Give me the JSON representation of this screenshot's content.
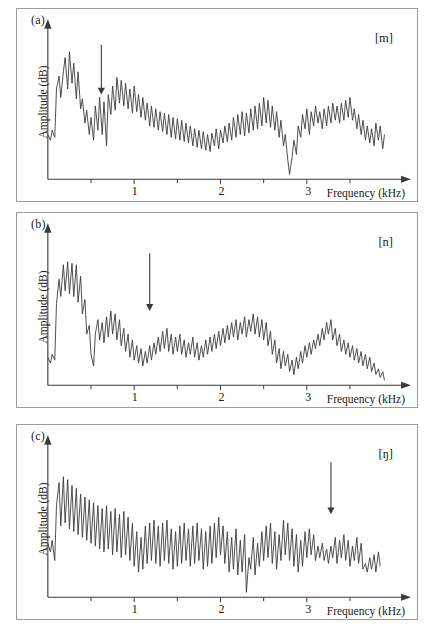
{
  "figure": {
    "background": "#ffffff",
    "line_color": "#3a3a3a",
    "axis_color": "#3a3a3a",
    "border_color": "#9a9a9a"
  },
  "chart_data": [
    {
      "type": "line",
      "panel": "a",
      "panel_label": "(a)",
      "annotation_label": "[m]",
      "title": "",
      "xlabel": "Frequency (kHz)",
      "ylabel": "Amplitude (dB)",
      "xlim": [
        0,
        4
      ],
      "ylim": [
        0,
        1
      ],
      "xticks": [
        1,
        2,
        3
      ],
      "xtick_labels": [
        "1",
        "2",
        "3"
      ],
      "minor_xticks": [
        0.5,
        1.5,
        2.5,
        3.5
      ],
      "grid": false,
      "legend": false,
      "arrow": {
        "x": 0.62,
        "y_top": 0.93,
        "y_bottom": 0.58,
        "direction": "down"
      },
      "x": [
        0.0,
        0.03,
        0.05,
        0.08,
        0.1,
        0.13,
        0.15,
        0.18,
        0.2,
        0.23,
        0.25,
        0.28,
        0.3,
        0.33,
        0.35,
        0.38,
        0.4,
        0.43,
        0.45,
        0.48,
        0.5,
        0.53,
        0.55,
        0.58,
        0.6,
        0.63,
        0.65,
        0.68,
        0.7,
        0.73,
        0.75,
        0.78,
        0.8,
        0.83,
        0.85,
        0.88,
        0.9,
        0.93,
        0.95,
        0.98,
        1.0,
        1.03,
        1.05,
        1.08,
        1.1,
        1.13,
        1.15,
        1.18,
        1.2,
        1.23,
        1.25,
        1.28,
        1.3,
        1.33,
        1.35,
        1.38,
        1.4,
        1.43,
        1.45,
        1.48,
        1.5,
        1.53,
        1.55,
        1.58,
        1.6,
        1.63,
        1.65,
        1.68,
        1.7,
        1.73,
        1.75,
        1.78,
        1.8,
        1.83,
        1.85,
        1.88,
        1.9,
        1.93,
        1.95,
        1.98,
        2.0,
        2.03,
        2.05,
        2.08,
        2.1,
        2.13,
        2.15,
        2.18,
        2.2,
        2.23,
        2.25,
        2.28,
        2.3,
        2.33,
        2.35,
        2.38,
        2.4,
        2.43,
        2.45,
        2.48,
        2.5,
        2.53,
        2.55,
        2.58,
        2.6,
        2.63,
        2.65,
        2.68,
        2.7,
        2.73,
        2.75,
        2.78,
        2.8,
        2.83,
        2.85,
        2.88,
        2.9,
        2.93,
        2.95,
        2.98,
        3.0,
        3.03,
        3.05,
        3.08,
        3.1,
        3.13,
        3.15,
        3.18,
        3.2,
        3.23,
        3.25,
        3.28,
        3.3,
        3.33,
        3.35,
        3.38,
        3.4,
        3.43,
        3.45,
        3.48,
        3.5,
        3.53,
        3.55,
        3.58,
        3.6,
        3.63,
        3.65,
        3.68,
        3.7,
        3.73,
        3.75,
        3.78,
        3.8,
        3.83,
        3.85,
        3.88,
        3.9
      ],
      "y": [
        0.3,
        0.26,
        0.33,
        0.28,
        0.62,
        0.71,
        0.56,
        0.74,
        0.84,
        0.62,
        0.88,
        0.66,
        0.8,
        0.55,
        0.74,
        0.48,
        0.55,
        0.38,
        0.47,
        0.3,
        0.42,
        0.26,
        0.5,
        0.33,
        0.56,
        0.3,
        0.53,
        0.22,
        0.58,
        0.44,
        0.64,
        0.47,
        0.7,
        0.52,
        0.68,
        0.5,
        0.66,
        0.48,
        0.62,
        0.45,
        0.64,
        0.46,
        0.58,
        0.42,
        0.56,
        0.4,
        0.52,
        0.36,
        0.5,
        0.35,
        0.48,
        0.33,
        0.46,
        0.32,
        0.45,
        0.3,
        0.44,
        0.28,
        0.42,
        0.27,
        0.41,
        0.26,
        0.4,
        0.25,
        0.38,
        0.24,
        0.36,
        0.22,
        0.34,
        0.21,
        0.33,
        0.2,
        0.32,
        0.19,
        0.3,
        0.18,
        0.31,
        0.22,
        0.34,
        0.2,
        0.33,
        0.24,
        0.36,
        0.25,
        0.38,
        0.26,
        0.42,
        0.28,
        0.44,
        0.3,
        0.46,
        0.29,
        0.45,
        0.31,
        0.48,
        0.33,
        0.5,
        0.34,
        0.52,
        0.36,
        0.56,
        0.38,
        0.54,
        0.35,
        0.5,
        0.33,
        0.46,
        0.28,
        0.4,
        0.22,
        0.3,
        0.12,
        0.02,
        0.14,
        0.26,
        0.16,
        0.36,
        0.28,
        0.44,
        0.34,
        0.48,
        0.3,
        0.46,
        0.36,
        0.5,
        0.38,
        0.46,
        0.34,
        0.48,
        0.36,
        0.5,
        0.38,
        0.52,
        0.4,
        0.5,
        0.38,
        0.52,
        0.4,
        0.54,
        0.42,
        0.56,
        0.4,
        0.48,
        0.34,
        0.44,
        0.3,
        0.4,
        0.26,
        0.36,
        0.24,
        0.34,
        0.22,
        0.38,
        0.26,
        0.36,
        0.2,
        0.3
      ]
    },
    {
      "type": "line",
      "panel": "b",
      "panel_label": "(b)",
      "annotation_label": "[n]",
      "title": "",
      "xlabel": "Frequency (kHz)",
      "ylabel": "Amplitude (dB)",
      "xlim": [
        0,
        4
      ],
      "ylim": [
        0,
        1
      ],
      "xticks": [
        1,
        2,
        3
      ],
      "xtick_labels": [
        "1",
        "2",
        "3"
      ],
      "minor_xticks": [
        0.5,
        1.5,
        2.5,
        3.5
      ],
      "grid": false,
      "legend": false,
      "arrow": {
        "x": 1.18,
        "y_top": 0.9,
        "y_bottom": 0.5,
        "direction": "down"
      },
      "x": [
        0.0,
        0.03,
        0.05,
        0.08,
        0.1,
        0.13,
        0.15,
        0.18,
        0.2,
        0.23,
        0.25,
        0.28,
        0.3,
        0.33,
        0.35,
        0.38,
        0.4,
        0.43,
        0.45,
        0.48,
        0.5,
        0.53,
        0.55,
        0.58,
        0.6,
        0.63,
        0.65,
        0.68,
        0.7,
        0.73,
        0.75,
        0.78,
        0.8,
        0.83,
        0.85,
        0.88,
        0.9,
        0.93,
        0.95,
        0.98,
        1.0,
        1.03,
        1.05,
        1.08,
        1.1,
        1.13,
        1.15,
        1.18,
        1.2,
        1.23,
        1.25,
        1.28,
        1.3,
        1.33,
        1.35,
        1.38,
        1.4,
        1.43,
        1.45,
        1.48,
        1.5,
        1.53,
        1.55,
        1.58,
        1.6,
        1.63,
        1.65,
        1.68,
        1.7,
        1.73,
        1.75,
        1.78,
        1.8,
        1.83,
        1.85,
        1.88,
        1.9,
        1.93,
        1.95,
        1.98,
        2.0,
        2.03,
        2.05,
        2.08,
        2.1,
        2.13,
        2.15,
        2.18,
        2.2,
        2.23,
        2.25,
        2.28,
        2.3,
        2.33,
        2.35,
        2.38,
        2.4,
        2.43,
        2.45,
        2.48,
        2.5,
        2.53,
        2.55,
        2.58,
        2.6,
        2.63,
        2.65,
        2.68,
        2.7,
        2.73,
        2.75,
        2.78,
        2.8,
        2.83,
        2.85,
        2.88,
        2.9,
        2.93,
        2.95,
        2.98,
        3.0,
        3.03,
        3.05,
        3.08,
        3.1,
        3.13,
        3.15,
        3.18,
        3.2,
        3.23,
        3.25,
        3.28,
        3.3,
        3.33,
        3.35,
        3.38,
        3.4,
        3.43,
        3.45,
        3.48,
        3.5,
        3.53,
        3.55,
        3.58,
        3.6,
        3.63,
        3.65,
        3.68,
        3.7,
        3.73,
        3.75,
        3.78,
        3.8,
        3.83,
        3.85,
        3.88,
        3.9
      ],
      "y": [
        0.18,
        0.14,
        0.2,
        0.16,
        0.55,
        0.72,
        0.6,
        0.82,
        0.64,
        0.84,
        0.62,
        0.83,
        0.6,
        0.82,
        0.56,
        0.74,
        0.48,
        0.58,
        0.34,
        0.4,
        0.2,
        0.12,
        0.34,
        0.44,
        0.3,
        0.42,
        0.28,
        0.46,
        0.32,
        0.5,
        0.34,
        0.48,
        0.3,
        0.44,
        0.26,
        0.38,
        0.22,
        0.34,
        0.18,
        0.3,
        0.16,
        0.26,
        0.14,
        0.24,
        0.12,
        0.22,
        0.14,
        0.26,
        0.16,
        0.28,
        0.2,
        0.32,
        0.22,
        0.36,
        0.24,
        0.38,
        0.22,
        0.34,
        0.2,
        0.32,
        0.22,
        0.34,
        0.2,
        0.3,
        0.18,
        0.28,
        0.2,
        0.32,
        0.18,
        0.28,
        0.16,
        0.26,
        0.18,
        0.3,
        0.2,
        0.32,
        0.22,
        0.34,
        0.24,
        0.36,
        0.26,
        0.38,
        0.28,
        0.4,
        0.3,
        0.42,
        0.32,
        0.44,
        0.3,
        0.42,
        0.34,
        0.46,
        0.32,
        0.44,
        0.36,
        0.48,
        0.34,
        0.46,
        0.32,
        0.44,
        0.3,
        0.42,
        0.26,
        0.36,
        0.2,
        0.3,
        0.14,
        0.24,
        0.1,
        0.22,
        0.12,
        0.2,
        0.08,
        0.16,
        0.06,
        0.18,
        0.1,
        0.22,
        0.14,
        0.26,
        0.18,
        0.28,
        0.2,
        0.3,
        0.24,
        0.34,
        0.26,
        0.38,
        0.3,
        0.42,
        0.34,
        0.44,
        0.3,
        0.38,
        0.26,
        0.34,
        0.22,
        0.3,
        0.2,
        0.28,
        0.18,
        0.26,
        0.16,
        0.24,
        0.14,
        0.22,
        0.12,
        0.2,
        0.1,
        0.18,
        0.08,
        0.14,
        0.06,
        0.1,
        0.04,
        0.08,
        0.02
      ]
    },
    {
      "type": "line",
      "panel": "c",
      "panel_label": "(c)",
      "annotation_label": "[ŋ]",
      "title": "",
      "xlabel": "Frequency (kHz)",
      "ylabel": "Amplitude (dB)",
      "xlim": [
        0,
        4
      ],
      "ylim": [
        0,
        1
      ],
      "xticks": [
        1,
        2,
        3
      ],
      "xtick_labels": [
        "1",
        "2",
        "3"
      ],
      "minor_xticks": [
        0.5,
        1.5,
        2.5,
        3.5
      ],
      "grid": false,
      "legend": false,
      "arrow": {
        "x": 3.28,
        "y_top": 0.92,
        "y_bottom": 0.56,
        "direction": "down"
      },
      "x": [
        0.0,
        0.03,
        0.05,
        0.08,
        0.1,
        0.13,
        0.15,
        0.18,
        0.2,
        0.23,
        0.25,
        0.28,
        0.3,
        0.33,
        0.35,
        0.38,
        0.4,
        0.43,
        0.45,
        0.48,
        0.5,
        0.53,
        0.55,
        0.58,
        0.6,
        0.63,
        0.65,
        0.68,
        0.7,
        0.73,
        0.75,
        0.78,
        0.8,
        0.83,
        0.85,
        0.88,
        0.9,
        0.93,
        0.95,
        0.98,
        1.0,
        1.03,
        1.05,
        1.08,
        1.1,
        1.13,
        1.15,
        1.18,
        1.2,
        1.23,
        1.25,
        1.28,
        1.3,
        1.33,
        1.35,
        1.38,
        1.4,
        1.43,
        1.45,
        1.48,
        1.5,
        1.53,
        1.55,
        1.58,
        1.6,
        1.63,
        1.65,
        1.68,
        1.7,
        1.73,
        1.75,
        1.78,
        1.8,
        1.83,
        1.85,
        1.88,
        1.9,
        1.93,
        1.95,
        1.98,
        2.0,
        2.03,
        2.05,
        2.08,
        2.1,
        2.13,
        2.15,
        2.18,
        2.2,
        2.23,
        2.25,
        2.28,
        2.3,
        2.33,
        2.35,
        2.38,
        2.4,
        2.43,
        2.45,
        2.48,
        2.5,
        2.53,
        2.55,
        2.58,
        2.6,
        2.63,
        2.65,
        2.68,
        2.7,
        2.73,
        2.75,
        2.78,
        2.8,
        2.83,
        2.85,
        2.88,
        2.9,
        2.93,
        2.95,
        2.98,
        3.0,
        3.03,
        3.05,
        3.08,
        3.1,
        3.13,
        3.15,
        3.18,
        3.2,
        3.23,
        3.25,
        3.28,
        3.3,
        3.33,
        3.35,
        3.38,
        3.4,
        3.43,
        3.45,
        3.48,
        3.5,
        3.53,
        3.55,
        3.58,
        3.6,
        3.63,
        3.65,
        3.68,
        3.7,
        3.73,
        3.75,
        3.78,
        3.8,
        3.83,
        3.85,
        3.88,
        3.9
      ],
      "y": [
        0.36,
        0.3,
        0.38,
        0.24,
        0.62,
        0.78,
        0.48,
        0.82,
        0.5,
        0.8,
        0.46,
        0.76,
        0.44,
        0.74,
        0.42,
        0.7,
        0.4,
        0.68,
        0.38,
        0.66,
        0.36,
        0.64,
        0.34,
        0.62,
        0.32,
        0.6,
        0.3,
        0.62,
        0.32,
        0.58,
        0.28,
        0.6,
        0.3,
        0.56,
        0.26,
        0.58,
        0.28,
        0.54,
        0.24,
        0.5,
        0.2,
        0.44,
        0.16,
        0.4,
        0.18,
        0.48,
        0.22,
        0.5,
        0.24,
        0.52,
        0.22,
        0.48,
        0.2,
        0.5,
        0.24,
        0.52,
        0.22,
        0.46,
        0.18,
        0.44,
        0.2,
        0.48,
        0.22,
        0.5,
        0.24,
        0.46,
        0.2,
        0.48,
        0.22,
        0.5,
        0.24,
        0.46,
        0.18,
        0.44,
        0.2,
        0.48,
        0.22,
        0.5,
        0.26,
        0.54,
        0.28,
        0.48,
        0.22,
        0.44,
        0.16,
        0.4,
        0.18,
        0.46,
        0.14,
        0.38,
        0.16,
        0.42,
        0.02,
        0.26,
        0.18,
        0.4,
        0.14,
        0.36,
        0.2,
        0.44,
        0.24,
        0.48,
        0.26,
        0.5,
        0.22,
        0.44,
        0.18,
        0.42,
        0.24,
        0.52,
        0.28,
        0.5,
        0.24,
        0.46,
        0.2,
        0.42,
        0.16,
        0.38,
        0.2,
        0.44,
        0.26,
        0.46,
        0.28,
        0.42,
        0.24,
        0.34,
        0.26,
        0.36,
        0.24,
        0.32,
        0.22,
        0.34,
        0.26,
        0.4,
        0.22,
        0.38,
        0.26,
        0.42,
        0.24,
        0.38,
        0.2,
        0.34,
        0.24,
        0.4,
        0.22,
        0.36,
        0.18,
        0.22,
        0.16,
        0.26,
        0.18,
        0.28,
        0.16,
        0.3,
        0.2
      ]
    }
  ]
}
